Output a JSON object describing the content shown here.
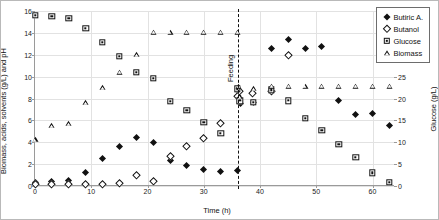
{
  "chart_data": {
    "type": "scatter",
    "title": "",
    "xlabel": "Time (h)",
    "ylabel": "Biomass, acids, solvents (g/L) and pH",
    "y2label": "Glucose (g/L)",
    "xlim": [
      0,
      64
    ],
    "ylim": [
      0,
      16
    ],
    "y2lim": [
      0,
      40
    ],
    "xticks": [
      0,
      10,
      20,
      30,
      40,
      50,
      60
    ],
    "yticks": [
      0,
      2,
      4,
      6,
      8,
      10,
      12,
      14,
      16
    ],
    "y2ticks": [
      0,
      5,
      10,
      15,
      20,
      25,
      30,
      35,
      40
    ],
    "grid": true,
    "legend_position": "top-right",
    "annotations": [
      {
        "text": "Feeding",
        "x": 36,
        "style": "vertical-dashed-line"
      }
    ],
    "series": [
      {
        "name": "Butiric A.",
        "marker": "filled-diamond",
        "axis": "left",
        "points": [
          [
            0,
            0.35
          ],
          [
            3,
            0.4
          ],
          [
            6,
            0.5
          ],
          [
            9,
            1.25
          ],
          [
            12,
            2.5
          ],
          [
            15,
            3.6
          ],
          [
            18,
            4.45
          ],
          [
            21,
            3.95
          ],
          [
            24,
            2.3
          ],
          [
            27,
            1.9
          ],
          [
            30,
            1.5
          ],
          [
            33,
            1.35
          ],
          [
            36,
            1.45
          ],
          [
            36.5,
            7.5
          ],
          [
            38.8,
            7.6
          ],
          [
            42,
            12.6
          ],
          [
            45,
            13.4
          ],
          [
            48,
            12.6
          ],
          [
            51,
            12.8
          ],
          [
            54,
            7.8
          ],
          [
            57,
            6.5
          ],
          [
            60,
            6.6
          ],
          [
            63,
            5.5
          ]
        ]
      },
      {
        "name": "Butanol",
        "marker": "open-diamond",
        "axis": "left",
        "points": [
          [
            0,
            0.1
          ],
          [
            3,
            0.12
          ],
          [
            6,
            0.15
          ],
          [
            9,
            0.12
          ],
          [
            12,
            0.14
          ],
          [
            15,
            0.2
          ],
          [
            18,
            1.0
          ],
          [
            21,
            0.45
          ],
          [
            24,
            2.7
          ],
          [
            27,
            3.6
          ],
          [
            30,
            4.35
          ],
          [
            33,
            5.75
          ],
          [
            36,
            8.15
          ],
          [
            36.3,
            8.6
          ],
          [
            38.6,
            8.5
          ],
          [
            42,
            8.6
          ],
          [
            45,
            11.9
          ],
          [
            54,
            17.6
          ]
        ]
      },
      {
        "name": "Glucose",
        "marker": "open-square",
        "axis": "right",
        "points": [
          [
            0,
            39.0
          ],
          [
            3,
            38.8
          ],
          [
            6,
            38.3
          ],
          [
            9,
            36.0
          ],
          [
            12,
            32.8
          ],
          [
            15,
            29.6
          ],
          [
            18,
            26.0
          ],
          [
            21,
            24.6
          ],
          [
            24,
            19.3
          ],
          [
            27,
            17.3
          ],
          [
            30,
            14.5
          ],
          [
            33,
            12.0
          ],
          [
            36,
            22.2
          ],
          [
            36.4,
            19.5
          ],
          [
            38.8,
            19.2
          ],
          [
            42,
            22.0
          ],
          [
            45,
            19.5
          ],
          [
            48,
            15.5
          ],
          [
            51,
            12.8
          ],
          [
            54,
            9.5
          ],
          [
            57,
            6.5
          ],
          [
            60,
            3.0
          ],
          [
            63,
            0.8
          ]
        ]
      },
      {
        "name": "Biomass",
        "marker": "open-triangle",
        "axis": "left",
        "points": [
          [
            0,
            4.25
          ],
          [
            3,
            5.5
          ],
          [
            6,
            5.7
          ],
          [
            9,
            7.6
          ],
          [
            12,
            9.0
          ],
          [
            15,
            10.4
          ],
          [
            18,
            12.0
          ],
          [
            21,
            14.05
          ],
          [
            24,
            14.05
          ],
          [
            27,
            14.05
          ],
          [
            30,
            14.05
          ],
          [
            33,
            14.05
          ],
          [
            36,
            14.05
          ],
          [
            36.2,
            9.1
          ],
          [
            36.4,
            8.15
          ],
          [
            38.8,
            8.9
          ],
          [
            42,
            9.1
          ],
          [
            45,
            9.1
          ],
          [
            48,
            9.1
          ],
          [
            51,
            9.1
          ],
          [
            54,
            9.1
          ],
          [
            57,
            9.1
          ],
          [
            60,
            9.1
          ],
          [
            63,
            9.1
          ]
        ]
      }
    ]
  },
  "legend": {
    "items": [
      {
        "label": "Butiric A.",
        "marker": "filled-diamond"
      },
      {
        "label": "Butanol",
        "marker": "open-diamond"
      },
      {
        "label": "Glucose",
        "marker": "open-square"
      },
      {
        "label": "Biomass",
        "marker": "open-triangle"
      }
    ]
  }
}
